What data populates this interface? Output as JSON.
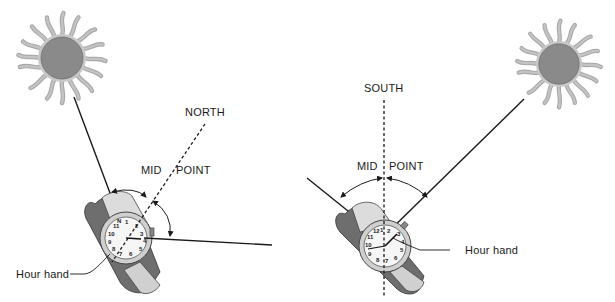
{
  "left_panel": {
    "direction_label": "NORTH",
    "mid_label": "MID",
    "point_label": "POINT",
    "hour_hand_label": "Hour hand"
  },
  "right_panel": {
    "direction_label": "SOUTH",
    "mid_label": "MID",
    "point_label": "POINT",
    "hour_hand_label": "Hour hand"
  },
  "colors": {
    "sun_core": "#8a8a8a",
    "sun_rays": "#b0b0b0",
    "line": "#1a1a1a",
    "strap": "#6e6e6e",
    "strap_light": "#c8c8c8",
    "face": "#f4f4f4"
  }
}
